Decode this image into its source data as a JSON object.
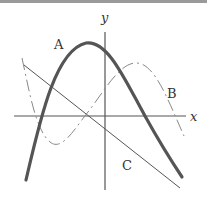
{
  "diagram": {
    "type": "function-graphs",
    "axes": {
      "x_label": "x",
      "y_label": "y",
      "origin_px": [
        105,
        116
      ]
    },
    "curves": [
      {
        "label": "A",
        "description": "downward-opening parabola, thick solid stroke",
        "style": "solid-thick",
        "color": "#555555",
        "points": [
          [
            26,
            180
          ],
          [
            43,
            116
          ],
          [
            60,
            66
          ],
          [
            86,
            43
          ],
          [
            108,
            56
          ],
          [
            145,
            116
          ],
          [
            182,
            177
          ]
        ]
      },
      {
        "label": "B",
        "description": "cubic-like curve, dashed stroke",
        "style": "dashed",
        "color": "#777777",
        "points": [
          [
            22,
            58
          ],
          [
            38,
            120
          ],
          [
            50,
            143
          ],
          [
            85,
            116
          ],
          [
            137,
            63
          ],
          [
            183,
            135
          ]
        ]
      },
      {
        "label": "C",
        "description": "straight line with negative slope, thin solid stroke",
        "style": "solid-thin",
        "color": "#555555",
        "points": [
          [
            24,
            65
          ],
          [
            180,
            188
          ]
        ]
      }
    ],
    "labels": {
      "A": "A",
      "B": "B",
      "C": "C"
    }
  }
}
